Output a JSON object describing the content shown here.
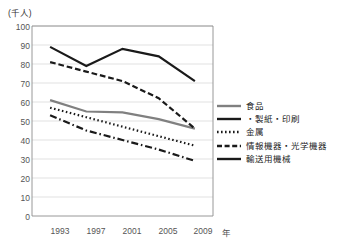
{
  "chart_data": {
    "type": "line",
    "title": "",
    "subtitle": "",
    "unit_label": "(千人)",
    "xlabel": "年",
    "ylabel": "",
    "x": [
      "1993",
      "1997",
      "2001",
      "2005",
      "2009"
    ],
    "categories": [
      "1993",
      "1997",
      "2001",
      "2005",
      "2009"
    ],
    "ylim": [
      0,
      100
    ],
    "yticks": [
      "0",
      "10",
      "20",
      "30",
      "40",
      "50",
      "60",
      "70",
      "80",
      "90",
      "100"
    ],
    "grid": true,
    "legend_position": "right",
    "series": [
      {
        "name": "食品",
        "values": [
          61,
          55,
          54.5,
          51,
          46
        ],
        "style": "solid",
        "color": "#808080",
        "width": 2.2
      },
      {
        "name": "・製紙・印刷",
        "values": [
          53,
          45,
          40,
          35,
          29
        ],
        "style": "dashdot",
        "color": "#1a1a1a",
        "width": 2.2
      },
      {
        "name": "金属",
        "values": [
          57,
          52,
          47,
          42,
          37
        ],
        "style": "dotted",
        "color": "#1a1a1a",
        "width": 2.2
      },
      {
        "name": "情報機器・光学機器",
        "values": [
          81,
          76,
          71,
          62,
          46
        ],
        "style": "dashed",
        "color": "#1a1a1a",
        "width": 2.2
      },
      {
        "name": "輸送用機械",
        "values": [
          89,
          79,
          88,
          84,
          71
        ],
        "style": "solid",
        "color": "#1a1a1a",
        "width": 2.2
      }
    ]
  },
  "legend": {
    "items": [
      {
        "label": "食品"
      },
      {
        "label": "・製紙・印刷"
      },
      {
        "label": "金属"
      },
      {
        "label": "情報機器・光学機器"
      },
      {
        "label": "輸送用機械"
      }
    ]
  },
  "axes": {
    "y_unit": "(千人)",
    "y_ticks": [
      "100",
      "90",
      "80",
      "70",
      "60",
      "50",
      "40",
      "30",
      "20",
      "10",
      "0"
    ],
    "x_ticks": [
      "1993",
      "1997",
      "2001",
      "2005",
      "2009"
    ],
    "x_unit": "年"
  }
}
